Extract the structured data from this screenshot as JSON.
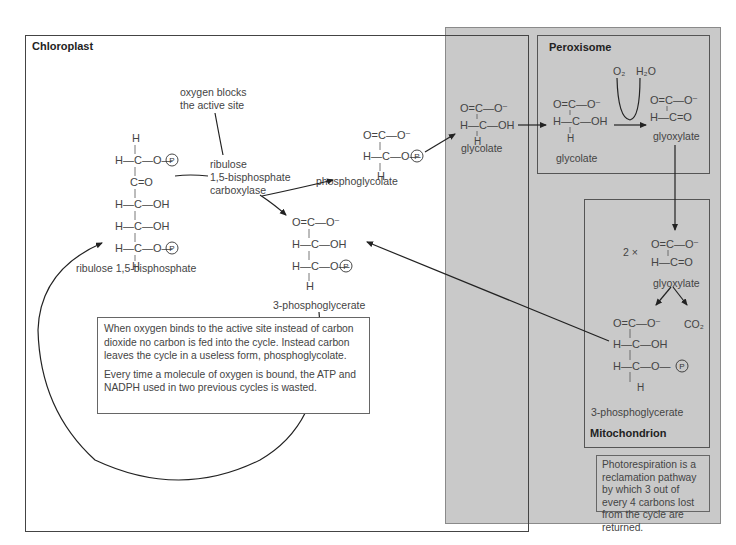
{
  "regions": {
    "chloroplast": "Chloroplast",
    "peroxisome": "Peroxisome",
    "mitochondrion": "Mitochondrion"
  },
  "labels": {
    "oxygen_blocks": "oxygen blocks\nthe active site",
    "rubisco": "ribulose\n1,5-bisphosphate\ncarboxylase",
    "rubp": "ribulose 1,5-bisphosphate",
    "phosphoglycolate": "phosphoglycolate",
    "pga_chloroplast": "3-phosphoglycerate",
    "glycolate_gray": "glycolate",
    "glycolate_perox": "glycolate",
    "glyoxylate_perox": "glyoxylate",
    "glyoxylate_mito": "glyoxylate",
    "pga_mito": "3-phosphoglycerate",
    "two_times": "2 ×",
    "o2": "O₂",
    "h2o": "H₂O",
    "co2": "CO₂"
  },
  "molecules": {
    "rubp": "      H\n      |\nH—C—O—(P)\n      |\n      C=O\n      |\nH—C—OH\n      |\nH—C—OH\n      |\nH—C—O—(P)\n      |\n      H",
    "phosphoglycolate": "O=C—O⁻\n     |\nH—C—O—(P)\n     |\n     H",
    "pga": "O=C—O⁻\n     |\nH—C—OH\n     |\nH—C—O—(P)\n     |\n     H",
    "glycolate": "O=C—O⁻\n     |\nH—C—OH\n     |\n     H",
    "glyoxylate": "O=C—O⁻\n     |\nH—C=O"
  },
  "notes": {
    "chloroplast_p1": "When oxygen binds to the active site instead of carbon dioxide no carbon is fed into the cycle. Instead carbon leaves the cycle in a useless form, phosphoglycolate.",
    "chloroplast_p2": "Every time a molecule of oxygen is bound, the ATP and NADPH used in two previous cycles is wasted.",
    "reclamation": "Photorespiration is a reclamation pathway by which 3 out of every 4 carbons lost from the cycle are returned."
  },
  "colors": {
    "gray_region": "#c9c9c9",
    "line": "#333333",
    "background": "#ffffff"
  }
}
